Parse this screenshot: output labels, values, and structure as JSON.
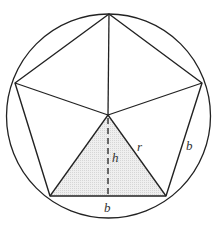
{
  "figure": {
    "labels": {
      "height": "h",
      "radius": "r",
      "base_bottom": "b",
      "side_right": "b"
    },
    "colors": {
      "stroke": "#222222",
      "shade": "#e6e6e6",
      "background": "#ffffff"
    }
  }
}
